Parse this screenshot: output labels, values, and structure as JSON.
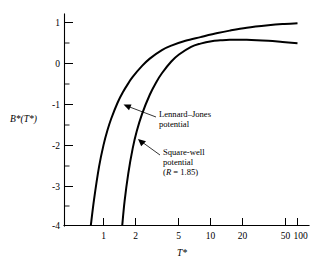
{
  "chart_data": {
    "type": "line",
    "title": "",
    "xlabel": "T*",
    "ylabel": "B*(T*)",
    "xscale": "log",
    "yscale": "linear",
    "xlim": [
      0.6,
      110
    ],
    "ylim": [
      -4,
      1.25
    ],
    "grid": false,
    "legend_position": "inline-annotation",
    "xticks": [
      {
        "value": 1,
        "label": "1"
      },
      {
        "value": 2,
        "label": "2"
      },
      {
        "value": 5,
        "label": "5"
      },
      {
        "value": 10,
        "label": "10"
      },
      {
        "value": 20,
        "label": "20"
      },
      {
        "value": 50,
        "label": "50"
      },
      {
        "value": 100,
        "label": "100"
      }
    ],
    "yticks": [
      {
        "value": 1,
        "label": "1"
      },
      {
        "value": 0,
        "label": "0"
      },
      {
        "value": -1,
        "label": "-1"
      },
      {
        "value": -2,
        "label": "-2"
      },
      {
        "value": -3,
        "label": "-3"
      },
      {
        "value": -4,
        "label": "-4"
      }
    ],
    "yticks_minor": [
      0.5,
      -0.5,
      -1.5,
      -2.5,
      -3.5
    ],
    "series": [
      {
        "name": "Lennard-Jones potential",
        "color": "#000000",
        "points": [
          {
            "x": 0.74,
            "y": -4.0
          },
          {
            "x": 0.8,
            "y": -3.35
          },
          {
            "x": 0.9,
            "y": -2.55
          },
          {
            "x": 1.0,
            "y": -2.02
          },
          {
            "x": 1.1,
            "y": -1.65
          },
          {
            "x": 1.2,
            "y": -1.37
          },
          {
            "x": 1.4,
            "y": -0.97
          },
          {
            "x": 1.6,
            "y": -0.7
          },
          {
            "x": 1.8,
            "y": -0.5
          },
          {
            "x": 2.0,
            "y": -0.34
          },
          {
            "x": 2.5,
            "y": -0.07
          },
          {
            "x": 3.0,
            "y": 0.11
          },
          {
            "x": 4.0,
            "y": 0.32
          },
          {
            "x": 5.0,
            "y": 0.43
          },
          {
            "x": 7.0,
            "y": 0.55
          },
          {
            "x": 10.0,
            "y": 0.64
          },
          {
            "x": 15.0,
            "y": 0.74
          },
          {
            "x": 20.0,
            "y": 0.8
          },
          {
            "x": 30.0,
            "y": 0.87
          },
          {
            "x": 50.0,
            "y": 0.93
          },
          {
            "x": 70.0,
            "y": 0.96
          },
          {
            "x": 100.0,
            "y": 0.98
          }
        ]
      },
      {
        "name": "Square-well potential (R = 1.85)",
        "color": "#000000",
        "points": [
          {
            "x": 1.56,
            "y": -4.0
          },
          {
            "x": 1.65,
            "y": -3.4
          },
          {
            "x": 1.8,
            "y": -2.72
          },
          {
            "x": 2.0,
            "y": -2.1
          },
          {
            "x": 2.2,
            "y": -1.68
          },
          {
            "x": 2.5,
            "y": -1.25
          },
          {
            "x": 3.0,
            "y": -0.78
          },
          {
            "x": 3.5,
            "y": -0.47
          },
          {
            "x": 4.0,
            "y": -0.25
          },
          {
            "x": 5.0,
            "y": 0.04
          },
          {
            "x": 6.0,
            "y": 0.21
          },
          {
            "x": 8.0,
            "y": 0.4
          },
          {
            "x": 10.0,
            "y": 0.48
          },
          {
            "x": 13.0,
            "y": 0.54
          },
          {
            "x": 16.0,
            "y": 0.56
          },
          {
            "x": 20.0,
            "y": 0.575
          },
          {
            "x": 30.0,
            "y": 0.575
          },
          {
            "x": 50.0,
            "y": 0.55
          },
          {
            "x": 70.0,
            "y": 0.52
          },
          {
            "x": 100.0,
            "y": 0.49
          }
        ]
      }
    ],
    "annotations": [
      {
        "id": "lennard-jones",
        "lines": [
          "Lennard–Jones",
          "potential"
        ],
        "target": {
          "x_px": 124,
          "y_px": 105
        }
      },
      {
        "id": "square-well",
        "lines": [
          "Square-well",
          "potential"
        ],
        "paren_prefix": "(",
        "paren_italic": "R",
        "paren_suffix": " = 1.85)",
        "target": {
          "x_px": 138,
          "y_px": 140
        }
      }
    ]
  }
}
